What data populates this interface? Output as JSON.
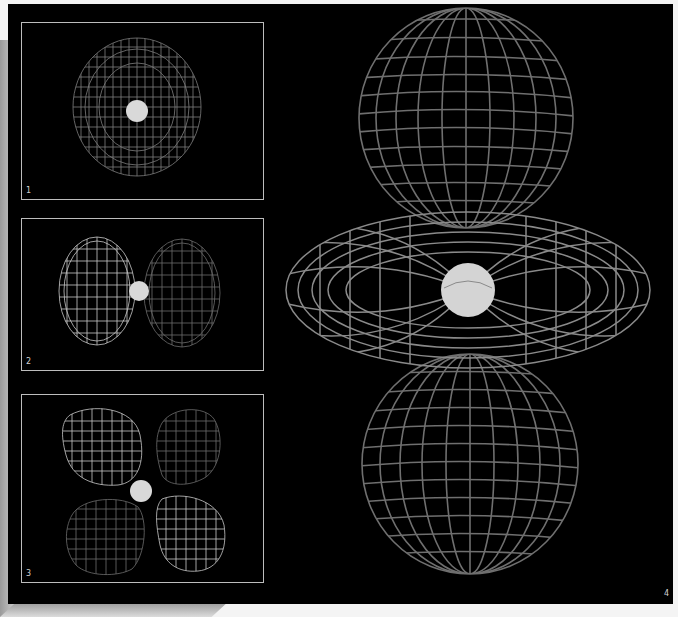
{
  "figure": {
    "background_color": "#000000",
    "frame_color": "#bdbdbd",
    "wire_color": "#8a8a8a",
    "nucleus_color": "#d9d9d9",
    "panels": [
      {
        "number": "1",
        "shape": "s-orbital sphere"
      },
      {
        "number": "2",
        "shape": "p-orbital two lobes"
      },
      {
        "number": "3",
        "shape": "d-orbital four lobes"
      },
      {
        "number": "4",
        "shape": "dz2 orbital two lobes with torus"
      }
    ]
  }
}
